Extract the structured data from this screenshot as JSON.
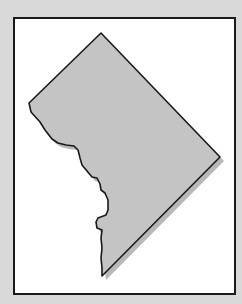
{
  "map": {
    "region": "Washington, D.C. outline",
    "colors": {
      "background": "#d9d9d9",
      "frame_fill": "#ffffff",
      "frame_border": "#1a1a1a",
      "region_fill": "#c4c4c4",
      "region_stroke": "#1a1a1a",
      "shadow": "#b5b5b5"
    }
  }
}
